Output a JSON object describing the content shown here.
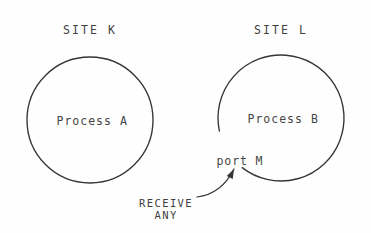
{
  "figure": {
    "type": "diagram",
    "background_color": "#fefefe",
    "ink_color": "#353535",
    "text_color": "#3f3f3f"
  },
  "sites": [
    {
      "id": "k",
      "title": "SITE K",
      "title_x": 90,
      "title_y": 30,
      "process_label": "Process A",
      "circle": {
        "cx": 90,
        "cy": 120,
        "r": 63,
        "gap": false
      }
    },
    {
      "id": "l",
      "title": "SITE L",
      "title_x": 281,
      "title_y": 30,
      "process_label": "Process B",
      "circle": {
        "cx": 281,
        "cy": 118,
        "r": 63,
        "gap": true,
        "gap_start_deg": 128,
        "gap_end_deg": 168
      }
    }
  ],
  "port": {
    "label": "port M",
    "x": 240,
    "y": 161
  },
  "annotation": {
    "line1": "RECEIVE",
    "line2": "ANY",
    "x": 166,
    "y": 203,
    "arrow": {
      "from_x": 197,
      "from_y": 197,
      "to_x": 234,
      "to_y": 169,
      "head": "up-right"
    }
  }
}
